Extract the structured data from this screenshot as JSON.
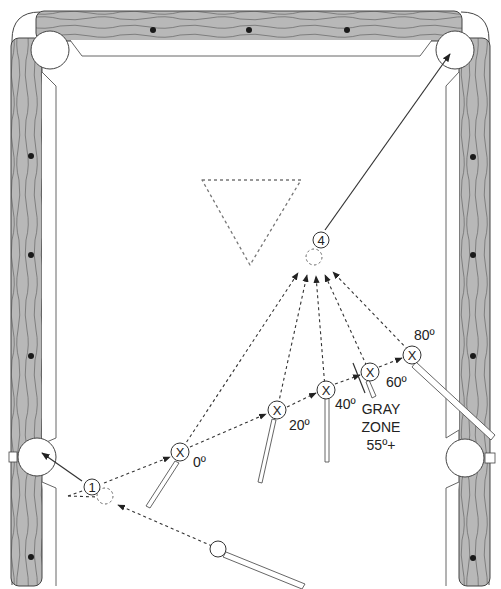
{
  "diagram": {
    "colors": {
      "rail": "#b8b8b8",
      "rail_grain": "#555555",
      "felt": "#ffffff",
      "line": "#333333",
      "diamond": "#1a1a1a"
    },
    "balls": {
      "object_ball_1": "1",
      "object_ball_4": "4",
      "cue_ball_marker": "X"
    },
    "angle_labels": {
      "a0": "0º",
      "a20": "20º",
      "a40": "40º",
      "a60": "60º",
      "a80": "80º"
    },
    "gray_zone": {
      "line1": "GRAY",
      "line2": "ZONE",
      "line3": "55º+"
    }
  }
}
